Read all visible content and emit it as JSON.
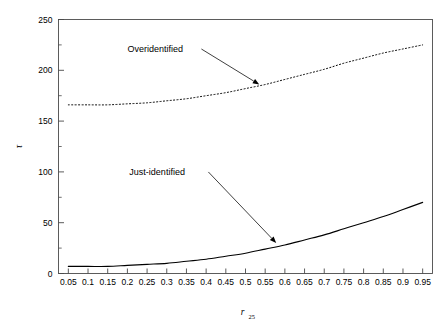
{
  "chart_data": {
    "type": "line",
    "title": "",
    "xlabel": "r25",
    "xlabel_base": "r",
    "xlabel_sub": "25",
    "ylabel": "τ",
    "xlim": [
      0.025,
      0.975
    ],
    "ylim": [
      0,
      250
    ],
    "grid": false,
    "legend_position": "none",
    "frame": "box",
    "xticks": [
      "0.05",
      "0.1",
      "0.15",
      "0.2",
      "0.25",
      "0.3",
      "0.35",
      "0.4",
      "0.45",
      "0.5",
      "0.55",
      "0.6",
      "0.65",
      "0.7",
      "0.75",
      "0.8",
      "0.85",
      "0.9",
      "0.95"
    ],
    "xtick_values": [
      0.05,
      0.1,
      0.15,
      0.2,
      0.25,
      0.3,
      0.35,
      0.4,
      0.45,
      0.5,
      0.55,
      0.6,
      0.65,
      0.7,
      0.75,
      0.8,
      0.85,
      0.9,
      0.95
    ],
    "yticks": [
      "0",
      "50",
      "100",
      "150",
      "200",
      "250"
    ],
    "ytick_values": [
      0,
      50,
      100,
      150,
      200,
      250
    ],
    "yminor_values": [
      25,
      75,
      125,
      175,
      225
    ],
    "x": [
      0.05,
      0.1,
      0.15,
      0.2,
      0.25,
      0.3,
      0.35,
      0.4,
      0.45,
      0.5,
      0.55,
      0.6,
      0.65,
      0.7,
      0.75,
      0.8,
      0.85,
      0.9,
      0.95
    ],
    "series": [
      {
        "name": "Overidentified",
        "style": "dotted",
        "color": "#000000",
        "values": [
          166,
          166,
          166,
          167,
          168,
          170,
          172,
          175,
          178,
          182,
          186,
          191,
          196,
          201,
          207,
          212,
          217,
          221,
          225
        ]
      },
      {
        "name": "Just-identified",
        "style": "solid",
        "color": "#000000",
        "values": [
          7,
          7,
          7,
          8,
          9,
          10,
          12,
          14,
          17,
          20,
          24,
          28,
          33,
          38,
          44,
          50,
          56,
          63,
          70
        ]
      }
    ],
    "annotations": [
      {
        "text": "Overidentified",
        "label_x": 0.2,
        "label_y": 218,
        "target_x": 0.535,
        "target_y": 186,
        "arrow": true
      },
      {
        "text": "Just-identified",
        "label_x": 0.205,
        "label_y": 97,
        "target_x": 0.578,
        "target_y": 30,
        "arrow": true
      }
    ]
  }
}
